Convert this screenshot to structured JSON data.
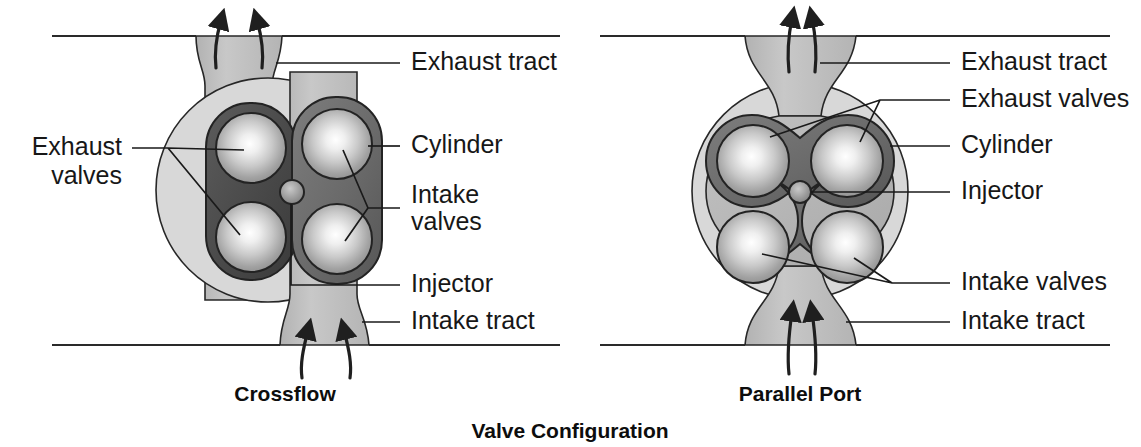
{
  "figure": {
    "title": "Valve Configuration",
    "panels": [
      {
        "id": "crossflow",
        "caption": "Crossflow",
        "labels": {
          "exhaust_tract": "Exhaust tract",
          "exhaust_valves": "Exhaust",
          "exhaust_valves_2": "valves",
          "cylinder": "Cylinder",
          "intake_valves": "Intake",
          "intake_valves_2": "valves",
          "injector": "Injector",
          "intake_tract": "Intake tract"
        }
      },
      {
        "id": "parallel-port",
        "caption": "Parallel Port",
        "labels": {
          "exhaust_tract": "Exhaust tract",
          "exhaust_valves": "Exhaust valves",
          "cylinder": "Cylinder",
          "injector": "Injector",
          "intake_valves": "Intake valves",
          "intake_tract": "Intake tract"
        }
      }
    ]
  },
  "colors": {
    "background": "#ffffff",
    "text": "#171717",
    "line": "#1f1f1f",
    "cylinder_fill": "#d6d6d6",
    "tract_fill": "#bcbcbc",
    "port_dark": "#6f6f6f",
    "port_darker": "#4b4b4b",
    "valve_highlight": "#f2f2f2",
    "valve_edge": "#8e8e8e",
    "injector_fill": "#8c8c8c"
  }
}
